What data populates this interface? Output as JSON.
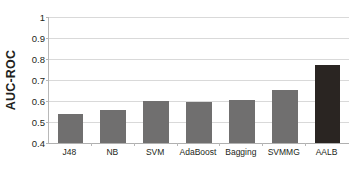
{
  "chart_data": {
    "type": "bar",
    "title": "",
    "xlabel": "",
    "ylabel": "AUC-ROC",
    "categories": [
      "J48",
      "NB",
      "SVM",
      "AdaBoost",
      "Bagging",
      "SVMMG",
      "AALB"
    ],
    "values": [
      0.54,
      0.555,
      0.6,
      0.593,
      0.607,
      0.651,
      0.77
    ],
    "ylim": [
      0.4,
      1.0
    ],
    "ytick_labels": [
      "1",
      "0.9",
      "0.8",
      "0.7",
      "0.6",
      "0.5",
      "0.4"
    ],
    "ytick_values": [
      1.0,
      0.9,
      0.8,
      0.7,
      0.6,
      0.5,
      0.4
    ],
    "grid": true,
    "legend": false,
    "legend_position": "none",
    "series": [
      {
        "name": "AUC-ROC",
        "values": [
          0.54,
          0.555,
          0.6,
          0.593,
          0.607,
          0.651,
          0.77
        ]
      }
    ],
    "bar_colors": [
      "#706f6f",
      "#706f6f",
      "#706f6f",
      "#706f6f",
      "#706f6f",
      "#706f6f",
      "#2a2522"
    ],
    "colors": {
      "bar_default": "#706f6f",
      "bar_highlight": "#2a2522",
      "gridline": "#d9d9d9",
      "axis": "#b8b8b8",
      "text": "#231f20",
      "background": "#ffffff"
    }
  }
}
